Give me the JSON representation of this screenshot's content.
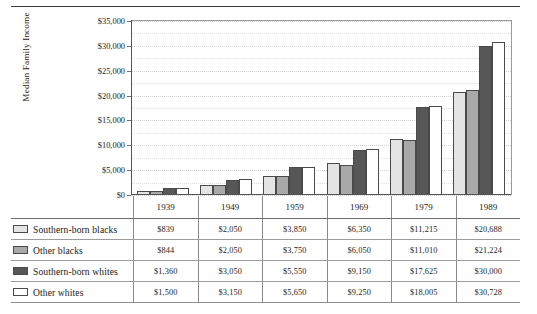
{
  "chart_data": {
    "type": "bar",
    "title": "",
    "xlabel": "",
    "ylabel": "Median Family Income",
    "categories": [
      "1939",
      "1949",
      "1959",
      "1969",
      "1979",
      "1989"
    ],
    "ylim": [
      0,
      35000
    ],
    "ytick_labels": [
      "$0",
      "$5,000",
      "$10,000",
      "$15,000",
      "$20,000",
      "$25,000",
      "$30,000",
      "$35,000"
    ],
    "ytick_values": [
      0,
      5000,
      10000,
      15000,
      20000,
      25000,
      30000,
      35000
    ],
    "grid": true,
    "grid_minor_step": 2500,
    "legend_position": "table-left",
    "series": [
      {
        "name": "Southern-born blacks",
        "color": "#e4e4e4",
        "values": [
          839,
          2050,
          3850,
          6350,
          11215,
          20688
        ],
        "labels": [
          "$839",
          "$2,050",
          "$3,850",
          "$6,350",
          "$11,215",
          "$20,688"
        ]
      },
      {
        "name": "Other blacks",
        "color": "#a9a9a9",
        "values": [
          844,
          2050,
          3750,
          6050,
          11010,
          21224
        ],
        "labels": [
          "$844",
          "$2,050",
          "$3,750",
          "$6,050",
          "$11,010",
          "$21,224"
        ]
      },
      {
        "name": "Southern-born whites",
        "color": "#575757",
        "values": [
          1360,
          3050,
          5550,
          9150,
          17625,
          30000
        ],
        "labels": [
          "$1,360",
          "$3,050",
          "$5,550",
          "$9,150",
          "$17,625",
          "$30,000"
        ]
      },
      {
        "name": "Other whites",
        "color": "#ffffff",
        "values": [
          1500,
          3150,
          5650,
          9250,
          18005,
          30728
        ],
        "labels": [
          "$1,500",
          "$3,150",
          "$5,650",
          "$9,250",
          "$18,005",
          "$30,728"
        ]
      }
    ]
  }
}
